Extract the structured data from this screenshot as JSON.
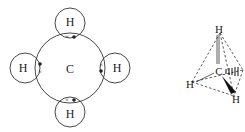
{
  "lewis": {
    "center": "C",
    "hydrogens": [
      {
        "label": "H",
        "pos": "top"
      },
      {
        "label": "H",
        "pos": "bottom"
      },
      {
        "label": "H",
        "pos": "left"
      },
      {
        "label": "H",
        "pos": "right"
      }
    ],
    "electron_marks": {
      "cross": "×",
      "dot": "●"
    }
  },
  "tetrahedral": {
    "center": "C",
    "hydrogens": [
      {
        "label": "H",
        "pos": "top"
      },
      {
        "label": "H",
        "pos": "left"
      },
      {
        "label": "H",
        "pos": "bottom-right"
      }
    ]
  },
  "colors": {
    "stroke": "#333333",
    "text": "#222222"
  }
}
